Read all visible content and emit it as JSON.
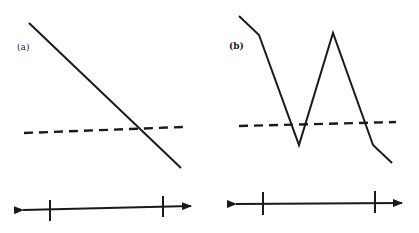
{
  "figure": {
    "panels": [
      {
        "id": "a",
        "label": "(a)",
        "solid_line": {
          "points": [
            [
              29,
              23
            ],
            [
              181,
              168
            ]
          ]
        },
        "dashed_line": {
          "points": [
            [
              24,
              133
            ],
            [
              183,
              127
            ]
          ]
        },
        "number_line": {
          "y_left": 210,
          "y_right": 206,
          "x_start": 23,
          "x_end": 191,
          "ticks": [
            {
              "x": 50,
              "y1": 200,
              "y2": 221
            },
            {
              "x": 163,
              "y1": 196,
              "y2": 217
            }
          ]
        }
      },
      {
        "id": "b",
        "label": "(b)",
        "solid_line": {
          "points": [
            [
              239,
              16
            ],
            [
              259,
              35
            ],
            [
              299,
              145
            ],
            [
              333,
              33
            ],
            [
              373,
              145
            ],
            [
              392,
              163
            ]
          ]
        },
        "dashed_line": {
          "points": [
            [
              239,
              126
            ],
            [
              396,
              122
            ]
          ]
        },
        "number_line": {
          "y_left": 204,
          "y_right": 203,
          "x_start": 236,
          "x_end": 402,
          "ticks": [
            {
              "x": 263,
              "y1": 192,
              "y2": 215
            },
            {
              "x": 375,
              "y1": 191,
              "y2": 213
            }
          ]
        }
      }
    ],
    "colors": {
      "stroke": "#1a1a1a",
      "background": "#ffffff",
      "label": "#222222"
    }
  }
}
